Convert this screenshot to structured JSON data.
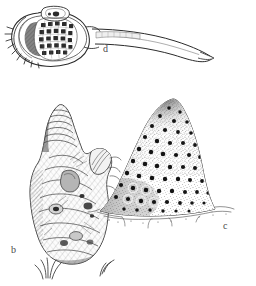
{
  "plate": {
    "kind": "scientific-illustration-plate",
    "background_color": "#ffffff",
    "ink_color": "#2b2b2b",
    "label_color": "#4a4a4a",
    "width": 256,
    "height": 286,
    "figures": [
      {
        "id": "d",
        "label": "d",
        "label_x": 103,
        "label_y": 44,
        "description": "tadpole-shaped body with rounded head bearing an internal rectangular grid, small apical chamber, marginal bristles, and a long tapering curved tail",
        "position": "top",
        "features": [
          "rounded-body",
          "internal-grid",
          "apical-chamber",
          "marginal-bristles",
          "long-tapering-tail"
        ],
        "grid_columns": 5,
        "grid_rows": 5
      },
      {
        "id": "b",
        "label": "b",
        "label_x": 11,
        "label_y": 245,
        "description": "upright irregular lumpy columnar structure with a banded finger-like apical projection, a lateral lobe, dense cross-hatched shading and grass-like tufts at the base",
        "position": "bottom-left",
        "features": [
          "apical-finger-projection",
          "lateral-lobe",
          "cross-hatched-shading",
          "basal-tufts"
        ]
      },
      {
        "id": "c",
        "label": "c",
        "label_x": 223,
        "label_y": 221,
        "description": "dome- or cone-shaped mound densely covered with dark pores ringed by stipple halos, darker shading along the left flank, and a wispy scattered base",
        "position": "bottom-right",
        "features": [
          "dome-outline",
          "dark-pores",
          "stipple-halos",
          "left-flank-shading",
          "wispy-base"
        ]
      }
    ]
  }
}
